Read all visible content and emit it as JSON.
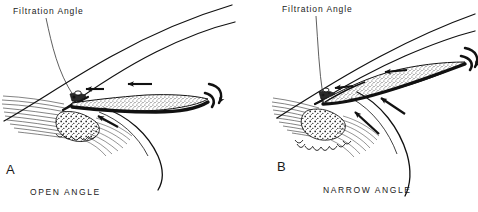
{
  "figure": {
    "background_color": "#ffffff",
    "ink_color": "#111111",
    "stipple_color": "#3a3a3a"
  },
  "panels": [
    {
      "id": "A",
      "letter": "A",
      "caption": "OPEN ANGLE",
      "callout_label": "Filtration Angle",
      "structures": [
        "corneal-epithelium-curve",
        "corneal-endothelium-curve",
        "scleral-fiber-hatching",
        "trabecular-meshwork",
        "schlemms-canal",
        "iris-stroma-stippled",
        "iris-pigment-epithelium",
        "ciliary-body",
        "zonular-fibers",
        "lens-capsule-curve",
        "pupil-margin-hook"
      ],
      "flow_arrows": [
        "aqueous-outflow-arrow-left",
        "aqueous-flow-arrow-mid",
        "aqueous-flow-arrow-posterior",
        "pupil-margin-curved-arrow"
      ]
    },
    {
      "id": "B",
      "letter": "B",
      "caption": "NARROW ANGLE",
      "callout_label": "Filtration Angle",
      "structures": [
        "corneal-epithelium-curve",
        "corneal-endothelium-curve",
        "scleral-fiber-hatching",
        "trabecular-meshwork",
        "schlemms-canal",
        "iris-stroma-stippled",
        "iris-pigment-epithelium",
        "ciliary-processes",
        "zonular-fibers",
        "lens-capsule-curve",
        "pupil-margin-hook",
        "iris-bombe-bow"
      ],
      "flow_arrows": [
        "aqueous-outflow-arrow-left",
        "aqueous-flow-arrow-mid",
        "pupillary-block-arrow",
        "pupil-margin-curved-arrow"
      ]
    }
  ]
}
